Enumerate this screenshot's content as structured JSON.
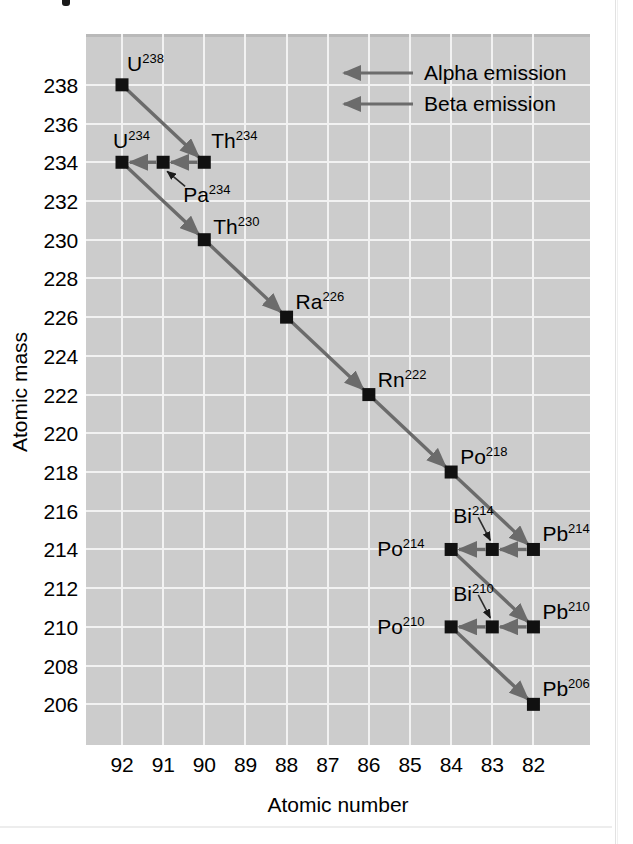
{
  "chart_data": {
    "type": "scatter",
    "title": "",
    "xlabel": "Atomic number",
    "ylabel": "Atomic mass",
    "xticks": [
      92,
      91,
      90,
      89,
      88,
      87,
      86,
      85,
      84,
      83,
      82
    ],
    "yticks": [
      238,
      236,
      234,
      232,
      230,
      228,
      226,
      224,
      222,
      220,
      218,
      216,
      214,
      212,
      210,
      208,
      206
    ],
    "xlim": [
      92.875,
      80.625
    ],
    "ylim": [
      240.625,
      203.9
    ],
    "grid": true,
    "legend_position": "top-right",
    "plot_background": "#cccccc",
    "gridline_color": "#f2f2f2",
    "marker_color": "#111111",
    "arrow_color": "#6b6b6b",
    "points": [
      {
        "label": "U",
        "mass": 238,
        "z": 92,
        "label_text": "U238",
        "label_pos": "above-right"
      },
      {
        "label": "Th",
        "mass": 234,
        "z": 90,
        "label_text": "Th234",
        "label_pos": "above-right"
      },
      {
        "label": "Pa",
        "mass": 234,
        "z": 91,
        "label_text": "Pa234",
        "label_pos": "callout-below-right"
      },
      {
        "label": "U",
        "mass": 234,
        "z": 92,
        "label_text": "U234",
        "label_pos": "above-right"
      },
      {
        "label": "Th",
        "mass": 230,
        "z": 90,
        "label_text": "Th230",
        "label_pos": "right"
      },
      {
        "label": "Ra",
        "mass": 226,
        "z": 88,
        "label_text": "Ra226",
        "label_pos": "above-right"
      },
      {
        "label": "Rn",
        "mass": 222,
        "z": 86,
        "label_text": "Rn222",
        "label_pos": "above-right"
      },
      {
        "label": "Po",
        "mass": 218,
        "z": 84,
        "label_text": "Po218",
        "label_pos": "above-right"
      },
      {
        "label": "Pb",
        "mass": 214,
        "z": 82,
        "label_text": "Pb214",
        "label_pos": "above-right"
      },
      {
        "label": "Bi",
        "mass": 214,
        "z": 83,
        "label_text": "Bi214",
        "label_pos": "callout-above-left"
      },
      {
        "label": "Po",
        "mass": 214,
        "z": 84,
        "label_text": "Po214",
        "label_pos": "left"
      },
      {
        "label": "Pb",
        "mass": 210,
        "z": 82,
        "label_text": "Pb210",
        "label_pos": "above-right"
      },
      {
        "label": "Bi",
        "mass": 210,
        "z": 83,
        "label_text": "Bi210",
        "label_pos": "callout-above-left"
      },
      {
        "label": "Po",
        "mass": 210,
        "z": 84,
        "label_text": "Po210",
        "label_pos": "left"
      },
      {
        "label": "Pb",
        "mass": 206,
        "z": 82,
        "label_text": "Pb206",
        "label_pos": "above-right"
      }
    ],
    "decays": [
      {
        "from": [
          92,
          238
        ],
        "to": [
          90,
          234
        ],
        "type": "alpha"
      },
      {
        "from": [
          90,
          234
        ],
        "to": [
          91,
          234
        ],
        "type": "beta"
      },
      {
        "from": [
          91,
          234
        ],
        "to": [
          92,
          234
        ],
        "type": "beta"
      },
      {
        "from": [
          92,
          234
        ],
        "to": [
          90,
          230
        ],
        "type": "alpha"
      },
      {
        "from": [
          90,
          230
        ],
        "to": [
          88,
          226
        ],
        "type": "alpha"
      },
      {
        "from": [
          88,
          226
        ],
        "to": [
          86,
          222
        ],
        "type": "alpha"
      },
      {
        "from": [
          86,
          222
        ],
        "to": [
          84,
          218
        ],
        "type": "alpha"
      },
      {
        "from": [
          84,
          218
        ],
        "to": [
          82,
          214
        ],
        "type": "alpha"
      },
      {
        "from": [
          82,
          214
        ],
        "to": [
          83,
          214
        ],
        "type": "beta"
      },
      {
        "from": [
          83,
          214
        ],
        "to": [
          84,
          214
        ],
        "type": "beta"
      },
      {
        "from": [
          84,
          214
        ],
        "to": [
          82,
          210
        ],
        "type": "alpha"
      },
      {
        "from": [
          82,
          210
        ],
        "to": [
          83,
          210
        ],
        "type": "beta"
      },
      {
        "from": [
          83,
          210
        ],
        "to": [
          84,
          210
        ],
        "type": "beta"
      },
      {
        "from": [
          84,
          210
        ],
        "to": [
          82,
          206
        ],
        "type": "alpha"
      }
    ]
  },
  "labels": {
    "U238": {
      "element": "U",
      "mass": "238"
    },
    "U234": {
      "element": "U",
      "mass": "234"
    },
    "Th234": {
      "element": "Th",
      "mass": "234"
    },
    "Pa234": {
      "element": "Pa",
      "mass": "234"
    },
    "Th230": {
      "element": "Th",
      "mass": "230"
    },
    "Ra226": {
      "element": "Ra",
      "mass": "226"
    },
    "Rn222": {
      "element": "Rn",
      "mass": "222"
    },
    "Po218": {
      "element": "Po",
      "mass": "218"
    },
    "Pb214": {
      "element": "Pb",
      "mass": "214"
    },
    "Bi214": {
      "element": "Bi",
      "mass": "214"
    },
    "Po214": {
      "element": "Po",
      "mass": "214"
    },
    "Pb210": {
      "element": "Pb",
      "mass": "210"
    },
    "Bi210": {
      "element": "Bi",
      "mass": "210"
    },
    "Po210": {
      "element": "Po",
      "mass": "210"
    },
    "Pb206": {
      "element": "Pb",
      "mass": "206"
    }
  },
  "legend": {
    "items": [
      {
        "label": "Alpha emission",
        "type": "alpha",
        "color": "#6b6b6b"
      },
      {
        "label": "Beta emission",
        "type": "beta",
        "color": "#6b6b6b"
      }
    ]
  }
}
